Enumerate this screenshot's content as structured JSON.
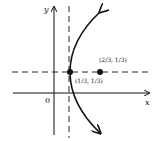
{
  "diagram": {
    "axes": {
      "x_label": "x",
      "y_label": "y",
      "origin_label": "0"
    },
    "vertex_label": "(1/3, 1/3)",
    "focus_label": "(2/3, 1/3)",
    "colors": {
      "ink": "#111111",
      "background": "#ffffff"
    }
  }
}
